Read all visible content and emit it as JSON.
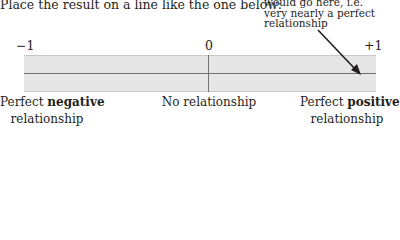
{
  "instruction": "Place the result on a line like the one below:",
  "annotation": {
    "lines": [
      "would go here, i.e.",
      "very nearly a perfect",
      "relationship"
    ]
  },
  "scale": {
    "min_label": "−1",
    "mid_label": "0",
    "max_label": "+1"
  },
  "labels": {
    "left": {
      "prefix": "Perfect ",
      "bold": "negative",
      "line2": "relationship"
    },
    "center": {
      "text": "No relationship"
    },
    "right": {
      "prefix": "Perfect ",
      "bold": "positive",
      "line2": "relationship"
    }
  },
  "colors": {
    "bar_fill": "#e6e6e6",
    "line": "#6f6f6f",
    "arrow": "#231f20"
  }
}
